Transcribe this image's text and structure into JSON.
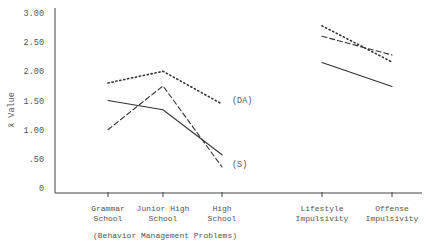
{
  "chart_data": {
    "type": "line",
    "title": "",
    "ylabel": "x̄ Value",
    "xlabel": "",
    "ylim": [
      0,
      3.0
    ],
    "yticks": [
      {
        "value": 0,
        "label": "0"
      },
      {
        "value": 0.5,
        "label": ".50"
      },
      {
        "value": 1.0,
        "label": "1.00"
      },
      {
        "value": 1.5,
        "label": "1.50"
      },
      {
        "value": 2.0,
        "label": "2.00"
      },
      {
        "value": 2.5,
        "label": "2.50"
      },
      {
        "value": 3.0,
        "label": "3.00"
      }
    ],
    "categories": [
      "Grammar School",
      "Junior High School",
      "High School",
      "Lifestyle Impulsivity",
      "Offense Impulsivity"
    ],
    "category_labels": [
      [
        "Grammar",
        "School"
      ],
      [
        "Junior High",
        "School"
      ],
      [
        "High",
        "School"
      ],
      [
        "Lifestyle",
        "Impulsivity"
      ],
      [
        "Offense",
        "Impulsivity"
      ]
    ],
    "group_label": "(Behavior Management Problems)",
    "groups": [
      {
        "label": "(Behavior Management Problems)",
        "categories": [
          0,
          1,
          2
        ]
      },
      {
        "label": "",
        "categories": [
          3,
          4
        ]
      }
    ],
    "grid": false,
    "legend": "none (inline annotations)",
    "annotations": [
      {
        "text": "(DA)",
        "series": "dotted",
        "near_category": "High School"
      },
      {
        "text": "(S)",
        "series": "dashed/solid",
        "near_category": "High School"
      }
    ],
    "series": [
      {
        "name": "DA (dotted)",
        "style": "dotted",
        "values": [
          1.8,
          2.0,
          1.44,
          2.78,
          2.16
        ]
      },
      {
        "name": "solid",
        "style": "solid",
        "values": [
          1.5,
          1.34,
          0.57,
          2.15,
          1.74
        ]
      },
      {
        "name": "S (dashed)",
        "style": "dashed",
        "values": [
          1.0,
          1.75,
          0.36,
          2.6,
          2.28
        ]
      }
    ]
  },
  "colors": {
    "axis": "#444444",
    "line": "#333333",
    "text": "#555555"
  }
}
